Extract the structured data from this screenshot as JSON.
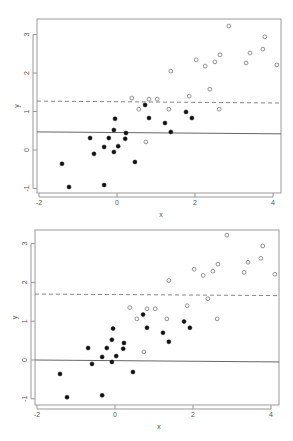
{
  "chart_data": [
    {
      "type": "scatter",
      "title": "",
      "xlabel": "x",
      "ylabel": "y",
      "xlim": [
        -2.1,
        4.2
      ],
      "ylim": [
        -1.1,
        3.4
      ],
      "xticks": [
        -2,
        0,
        2,
        4
      ],
      "yticks": [
        -1,
        0,
        1,
        2,
        3
      ],
      "grid": false,
      "legend": null,
      "series": [
        {
          "name": "open",
          "marker": "open-circle",
          "points": [
            [
              0.38,
              1.35
            ],
            [
              0.56,
              1.06
            ],
            [
              0.82,
              1.32
            ],
            [
              1.03,
              1.32
            ],
            [
              0.74,
              0.21
            ],
            [
              1.33,
              1.06
            ],
            [
              1.38,
              2.05
            ],
            [
              1.85,
              1.4
            ],
            [
              2.03,
              2.34
            ],
            [
              2.26,
              2.18
            ],
            [
              2.38,
              1.58
            ],
            [
              2.51,
              2.29
            ],
            [
              2.62,
              1.06
            ],
            [
              2.64,
              2.47
            ],
            [
              2.87,
              3.22
            ],
            [
              3.31,
              2.26
            ],
            [
              3.41,
              2.52
            ],
            [
              3.74,
              2.62
            ],
            [
              3.79,
              2.94
            ],
            [
              4.1,
              2.21
            ]
          ]
        },
        {
          "name": "filled",
          "marker": "filled-circle",
          "points": [
            [
              -1.41,
              -0.36
            ],
            [
              -1.23,
              -0.96
            ],
            [
              -0.69,
              0.31
            ],
            [
              -0.59,
              -0.1
            ],
            [
              -0.33,
              0.08
            ],
            [
              -0.33,
              -0.91
            ],
            [
              -0.21,
              0.31
            ],
            [
              -0.08,
              -0.05
            ],
            [
              -0.08,
              0.52
            ],
            [
              -0.05,
              0.81
            ],
            [
              0.03,
              0.1
            ],
            [
              0.21,
              0.29
            ],
            [
              0.23,
              0.44
            ],
            [
              0.46,
              -0.31
            ],
            [
              0.72,
              1.17
            ],
            [
              0.82,
              0.83
            ],
            [
              1.23,
              0.7
            ],
            [
              1.38,
              0.47
            ],
            [
              1.77,
              0.99
            ],
            [
              1.92,
              0.83
            ]
          ]
        }
      ],
      "lines": [
        {
          "style": "solid",
          "y_left": 0.47,
          "y_right": 0.42
        },
        {
          "style": "dashed",
          "y_left": 1.27,
          "y_right": 1.22
        }
      ]
    },
    {
      "type": "scatter",
      "title": "",
      "xlabel": "x",
      "ylabel": "y",
      "xlim": [
        -2.1,
        4.2
      ],
      "ylim": [
        -1.1,
        3.4
      ],
      "xticks": [
        -2,
        0,
        2,
        4
      ],
      "yticks": [
        -1,
        0,
        1,
        2,
        3
      ],
      "grid": false,
      "legend": null,
      "series": [
        {
          "name": "open",
          "marker": "open-circle",
          "points": [
            [
              0.38,
              1.35
            ],
            [
              0.56,
              1.06
            ],
            [
              0.82,
              1.32
            ],
            [
              1.03,
              1.32
            ],
            [
              0.74,
              0.21
            ],
            [
              1.33,
              1.06
            ],
            [
              1.38,
              2.05
            ],
            [
              1.85,
              1.4
            ],
            [
              2.03,
              2.34
            ],
            [
              2.26,
              2.18
            ],
            [
              2.38,
              1.58
            ],
            [
              2.51,
              2.29
            ],
            [
              2.62,
              1.06
            ],
            [
              2.64,
              2.47
            ],
            [
              2.87,
              3.22
            ],
            [
              3.31,
              2.26
            ],
            [
              3.41,
              2.52
            ],
            [
              3.74,
              2.62
            ],
            [
              3.79,
              2.94
            ],
            [
              4.1,
              2.21
            ]
          ]
        },
        {
          "name": "filled",
          "marker": "filled-circle",
          "points": [
            [
              -1.41,
              -0.36
            ],
            [
              -1.23,
              -0.96
            ],
            [
              -0.69,
              0.31
            ],
            [
              -0.59,
              -0.1
            ],
            [
              -0.33,
              0.08
            ],
            [
              -0.33,
              -0.91
            ],
            [
              -0.21,
              0.31
            ],
            [
              -0.08,
              -0.05
            ],
            [
              -0.08,
              0.52
            ],
            [
              -0.05,
              0.81
            ],
            [
              0.03,
              0.1
            ],
            [
              0.21,
              0.29
            ],
            [
              0.23,
              0.44
            ],
            [
              0.46,
              -0.31
            ],
            [
              0.72,
              1.17
            ],
            [
              0.82,
              0.83
            ],
            [
              1.23,
              0.7
            ],
            [
              1.38,
              0.47
            ],
            [
              1.77,
              0.99
            ],
            [
              1.92,
              0.83
            ]
          ]
        }
      ],
      "lines": [
        {
          "style": "solid",
          "y_left": 0.0,
          "y_right": -0.05
        },
        {
          "style": "dashed",
          "y_left": 1.7,
          "y_right": 1.66
        }
      ]
    }
  ],
  "layout": [
    {
      "box": [
        37,
        19,
        281,
        193
      ],
      "x0px": 117,
      "xscale": 39,
      "y0px": 150,
      "yscale": 38.5
    },
    {
      "box": [
        35,
        10,
        279,
        185
      ],
      "x0px": 115,
      "xscale": 39,
      "y0px": 140,
      "yscale": 38.8
    }
  ]
}
